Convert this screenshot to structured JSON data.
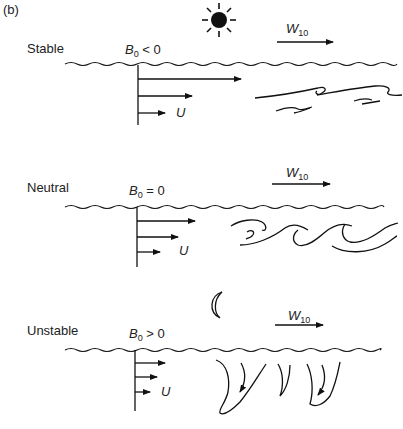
{
  "figure": {
    "panel_label": "(b)",
    "wind_symbol": "W",
    "wind_subscript": "10",
    "velocity_symbol": "U",
    "buoyancy_symbol": "B",
    "buoyancy_subscript": "0"
  },
  "panels": [
    {
      "regime": "Stable",
      "condition": "< 0",
      "sky_icon": "sun-icon",
      "eddy_style": "flattened-horizontal"
    },
    {
      "regime": "Neutral",
      "condition": "= 0",
      "sky_icon": "none",
      "eddy_style": "rolling-waves"
    },
    {
      "regime": "Unstable",
      "condition": "> 0",
      "sky_icon": "moon-icon",
      "eddy_style": "convective-plumes"
    }
  ],
  "colors": {
    "ink": "#111111",
    "background": "#ffffff"
  }
}
